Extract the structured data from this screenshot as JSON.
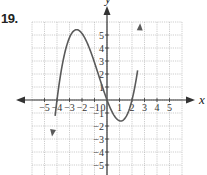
{
  "problem": {
    "number": "19."
  },
  "chart_data": {
    "type": "line",
    "title": "",
    "xlabel": "x",
    "ylabel": "y",
    "xlim": [
      -6,
      6
    ],
    "ylim": [
      -6,
      6
    ],
    "grid": true,
    "x_ticks": [
      -5,
      -4,
      -3,
      -2,
      -1,
      0,
      1,
      2,
      3,
      4,
      5
    ],
    "y_ticks": [
      -5,
      -4,
      -3,
      -2,
      -1,
      1,
      2,
      3,
      4,
      5
    ],
    "x_tick_labels": [
      "−5",
      "−4",
      "−3",
      "−2",
      "−1",
      "0",
      "1",
      "2",
      "3",
      "4",
      "5"
    ],
    "y_tick_labels": [
      "−5",
      "−4",
      "−3",
      "−2",
      "−1",
      "1",
      "2",
      "3",
      "4",
      "5"
    ],
    "series": [
      {
        "name": "f(x)",
        "description": "cubic polynomial with zeros at x = -4, 0, 2; local max near (-2.4, 5.4); local min near (1.1, -1.6); arrows at both ends",
        "x": [
          -4.4,
          -4,
          -3.5,
          -3,
          -2.4,
          -2,
          -1.5,
          -1,
          -0.5,
          0,
          0.5,
          1,
          1.1,
          1.5,
          2,
          2.3,
          2.65
        ],
        "y": [
          -2.8,
          0,
          3.4,
          4.8,
          5.4,
          5.1,
          4.2,
          3.0,
          1.5,
          0,
          -1.1,
          -1.6,
          -1.6,
          -1.3,
          0,
          1.7,
          5.9
        ]
      }
    ]
  },
  "colors": {
    "curve": "#5a5a5a",
    "axis": "#333333",
    "grid": "#b8b8b8"
  }
}
